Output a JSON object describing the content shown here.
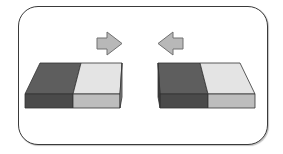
{
  "diagram": {
    "colors": {
      "frame": "#3a3a3a",
      "dark_top": "#5e5e5e",
      "dark_front": "#4a4a4a",
      "light_top": "#e4e4e4",
      "light_front": "#bdbdbd",
      "arrow_fill": "#b8b8b8",
      "arrow_stroke": "#707070",
      "edge": "#333333"
    },
    "arrows": [
      {
        "id": "arrow-right",
        "direction": "right"
      },
      {
        "id": "arrow-left",
        "direction": "left"
      }
    ],
    "blocks": [
      {
        "id": "left-block",
        "segments": [
          "dark",
          "light"
        ]
      },
      {
        "id": "right-block",
        "segments": [
          "dark",
          "light"
        ]
      }
    ]
  }
}
